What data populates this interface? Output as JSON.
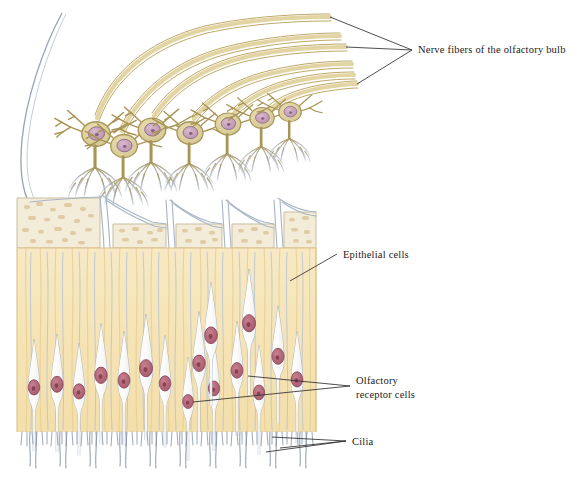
{
  "figure": {
    "background_color": "#ffffff"
  },
  "labels": [
    {
      "id": "nerve-fibers",
      "text": "Nerve fibers of the olfactory bulb",
      "x": 418,
      "y": 50
    },
    {
      "id": "epithelial-cells",
      "text": "Epithelial cells",
      "x": 343,
      "y": 256
    },
    {
      "id": "olfactory-receptor-cells-line1",
      "text": "Olfactory",
      "x": 356,
      "y": 383
    },
    {
      "id": "olfactory-receptor-cells-line2",
      "text": "receptor cells",
      "x": 356,
      "y": 397
    },
    {
      "id": "cilia",
      "text": "Cilia",
      "x": 352,
      "y": 444
    }
  ],
  "colors": {
    "nerve_fiber_fill": "#e3d4a4",
    "nerve_fiber_stroke": "#b59d55",
    "cell_body_fill": "#ddd1a0",
    "cell_body_stroke": "#a89555",
    "nucleus_fill": "#c9a3bd",
    "nucleus_stroke": "#8d6a86",
    "nucleolus_fill": "#7c5473",
    "bulb_outline": "#8a97ad",
    "bone_fill": "#f3ecd9",
    "bone_speckle": "#ddc9a0",
    "epithelium_fill": "#f5e4b6",
    "epithelium_stripe": "#e8cf92",
    "receptor_cell_fill": "#fdfdfd",
    "receptor_cell_stroke": "#a9b6c6",
    "receptor_nucleus_fill": "#b4697a",
    "receptor_nucleus_stroke": "#8a4457",
    "receptor_nucleolus": "#7d3647",
    "axon_stroke": "#a8b5c5",
    "cilia_stroke": "#8a97ab",
    "leader_line": "#2e2e2e",
    "label_text": "#1a1a1a"
  },
  "structures": {
    "mitral_cells_count": 7,
    "nerve_fiber_count": 6,
    "bone_block_count": 5,
    "receptor_cell_count": 16,
    "layers": [
      "olfactory bulb",
      "cribriform plate (bone)",
      "olfactory epithelium",
      "cilia layer"
    ]
  }
}
